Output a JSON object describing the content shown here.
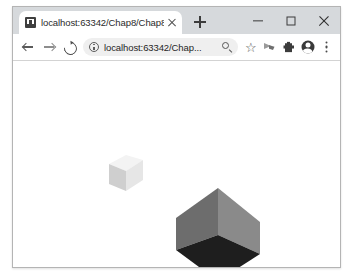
{
  "window": {
    "controls": {
      "minimize_label": "Minimize",
      "maximize_label": "Maximize",
      "close_label": "Close"
    }
  },
  "tabstrip": {
    "tabs": [
      {
        "title": "localhost:63342/Chap8/Chap8",
        "favicon": "document-favicon",
        "close_label": "Close tab",
        "active": true
      }
    ],
    "new_tab_label": "New tab"
  },
  "toolbar": {
    "back_label": "Back",
    "forward_label": "Forward",
    "reload_label": "Reload this page",
    "omnibox": {
      "site_info_label": "View site information",
      "url": "localhost:63342/Chap...",
      "placeholder": "Search Google or type a URL",
      "zoom_label": "Zoom"
    },
    "bookmark_label": "Bookmark this tab",
    "ribbon_label": "Ribbon extension",
    "extensions_label": "Extensions",
    "profile_label": "Profile",
    "menu_label": "Customize and control Google Chrome"
  },
  "page": {
    "background": "#ffffff",
    "scene": {
      "name": "two-isometric-cubes",
      "cubes": [
        {
          "name": "small-light-cube",
          "center_x": 113,
          "center_y": 112,
          "half_width": 17,
          "top_height": 10,
          "side_height": 20,
          "faces": {
            "top": "#f3f3f3",
            "left": "#cfcfcf",
            "right": "#e6e6e6"
          },
          "orientation": "top-up"
        },
        {
          "name": "large-gray-cube",
          "center_x": 205,
          "center_y": 172,
          "half_width": 42,
          "top_height": 24,
          "side_height": 28,
          "faces": {
            "top": "#1e1e1e",
            "left": "#6d6d6d",
            "right": "#8a8a8a"
          },
          "orientation": "point-down"
        }
      ]
    }
  }
}
